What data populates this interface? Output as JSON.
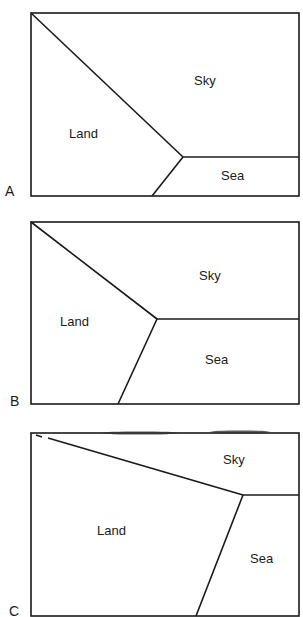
{
  "panels": [
    {
      "id": "A",
      "label": "A",
      "regions": {
        "land": "Land",
        "sky": "Sky",
        "sea": "Sea"
      }
    },
    {
      "id": "B",
      "label": "B",
      "regions": {
        "land": "Land",
        "sky": "Sky",
        "sea": "Sea"
      }
    },
    {
      "id": "C",
      "label": "C",
      "regions": {
        "land": "Land",
        "sky": "Sky",
        "sea": "Sea"
      }
    }
  ],
  "colors": {
    "line": "#1a1a1a",
    "background": "#ffffff"
  }
}
